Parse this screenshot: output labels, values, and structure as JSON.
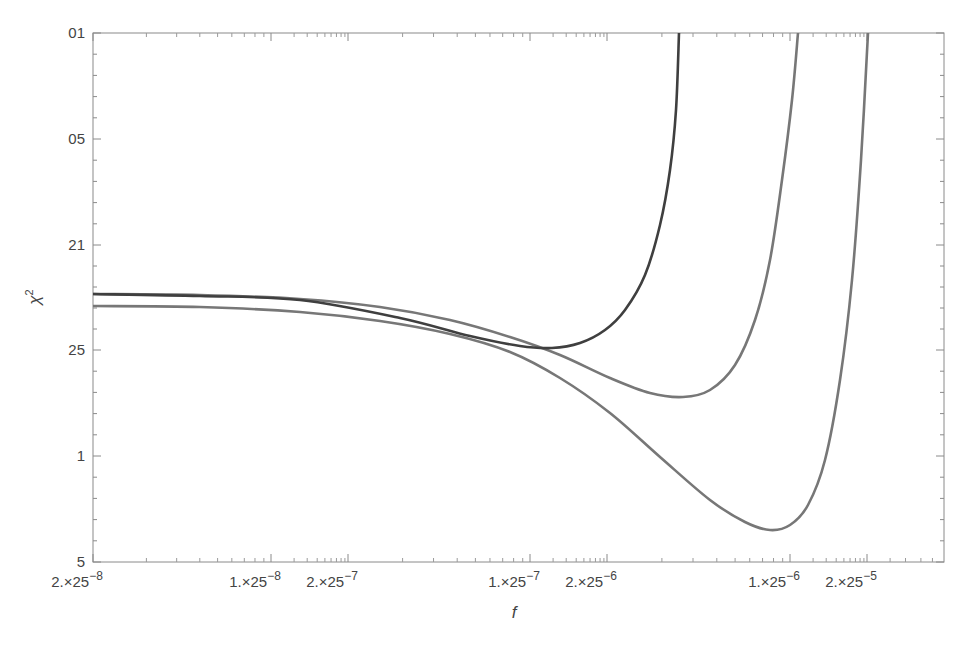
{
  "chart_data": {
    "type": "line",
    "title": "",
    "xlabel": "f",
    "ylabel": "χ²",
    "x_scale": "log",
    "grid": false,
    "legend": "none",
    "frame": {
      "left": 93,
      "right": 944,
      "top": 33,
      "bottom": 562
    },
    "y_ticks": [
      {
        "label": "01",
        "y": 33
      },
      {
        "label": "05",
        "y": 139
      },
      {
        "label": "21",
        "y": 245
      },
      {
        "label": "25",
        "y": 350
      },
      {
        "label": "1",
        "y": 456
      },
      {
        "label": "5",
        "y": 562
      }
    ],
    "x_ticks": [
      {
        "mantissa": "2.",
        "base": "25",
        "exp": "−8",
        "x": 93
      },
      {
        "mantissa": "1.",
        "base": "25",
        "exp": "−8",
        "x": 271
      },
      {
        "mantissa": "2.",
        "base": "25",
        "exp": "−7",
        "x": 348
      },
      {
        "mantissa": "1.",
        "base": "25",
        "exp": "−7",
        "x": 530
      },
      {
        "mantissa": "2.",
        "base": "25",
        "exp": "−6",
        "x": 607
      },
      {
        "mantissa": "1.",
        "base": "25",
        "exp": "−6",
        "x": 790
      },
      {
        "mantissa": "2.",
        "base": "25",
        "exp": "−5",
        "x": 867
      }
    ],
    "series": [
      {
        "name": "curve-1",
        "color": "#3f3f3f",
        "points_px": [
          [
            93,
            294
          ],
          [
            200,
            296
          ],
          [
            300,
            300
          ],
          [
            400,
            318
          ],
          [
            470,
            336
          ],
          [
            520,
            346
          ],
          [
            552,
            348
          ],
          [
            580,
            343
          ],
          [
            605,
            330
          ],
          [
            625,
            310
          ],
          [
            645,
            275
          ],
          [
            660,
            225
          ],
          [
            670,
            170
          ],
          [
            676,
            110
          ],
          [
            679,
            33
          ]
        ]
      },
      {
        "name": "curve-2",
        "color": "#777777",
        "points_px": [
          [
            93,
            294
          ],
          [
            200,
            295
          ],
          [
            300,
            299
          ],
          [
            380,
            307
          ],
          [
            450,
            320
          ],
          [
            510,
            337
          ],
          [
            560,
            355
          ],
          [
            610,
            378
          ],
          [
            650,
            393
          ],
          [
            683,
            397
          ],
          [
            710,
            390
          ],
          [
            735,
            365
          ],
          [
            755,
            320
          ],
          [
            770,
            260
          ],
          [
            782,
            180
          ],
          [
            792,
            100
          ],
          [
            798,
            33
          ]
        ]
      },
      {
        "name": "curve-3",
        "color": "#777777",
        "points_px": [
          [
            93,
            306
          ],
          [
            200,
            307
          ],
          [
            300,
            312
          ],
          [
            380,
            321
          ],
          [
            450,
            334
          ],
          [
            510,
            352
          ],
          [
            560,
            378
          ],
          [
            610,
            413
          ],
          [
            660,
            457
          ],
          [
            710,
            500
          ],
          [
            745,
            522
          ],
          [
            770,
            530
          ],
          [
            790,
            525
          ],
          [
            808,
            505
          ],
          [
            825,
            460
          ],
          [
            840,
            380
          ],
          [
            852,
            280
          ],
          [
            861,
            160
          ],
          [
            868,
            33
          ]
        ]
      }
    ]
  }
}
